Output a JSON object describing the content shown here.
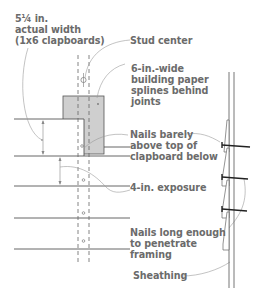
{
  "colors": {
    "text": "#6b6b6b",
    "line": "#555555",
    "leader": "#9a9a9a",
    "building_paper": "#cfcfcf",
    "nail": "#222222"
  },
  "labels": {
    "width_line1": "5¼ in.",
    "width_line2": "actual width",
    "width_line3": "(1x6 clapboards)",
    "stud_center": "Stud center",
    "paper_line1": "6-in.-wide",
    "paper_line2": "building paper",
    "paper_line3": "splines behind",
    "paper_line4": "joints",
    "nails_above_line1": "Nails barely",
    "nails_above_line2": "above top of",
    "nails_above_line3": "clapboard below",
    "exposure": "4-in. exposure",
    "nails_long_line1": "Nails long enough",
    "nails_long_line2": "to penetrate",
    "nails_long_line3": "framing",
    "sheathing": "Sheathing"
  }
}
